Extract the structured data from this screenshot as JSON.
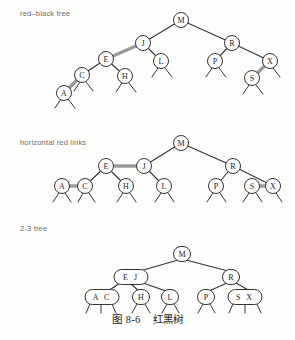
{
  "figure": {
    "caption_label": "图 8-6",
    "caption_title": "红黑树",
    "panels": [
      {
        "id": "panel-red-black-tree",
        "label": "red–black tree"
      },
      {
        "id": "panel-horizontal-links",
        "label": "horizontal red links"
      },
      {
        "id": "panel-two-three-tree",
        "label": "2-3 tree"
      }
    ]
  },
  "colors": {
    "ink": "#222222",
    "label_gray": "#6e6e6e",
    "red_link": "#9a9a9a",
    "black_link": "#333333",
    "node_fill": "#ffffff",
    "page": "#fdfdfb"
  },
  "panel1": {
    "label": "red–black tree",
    "nodes": [
      {
        "key": "M",
        "x": 181,
        "y": 20,
        "r": 7.5
      },
      {
        "key": "J",
        "x": 143,
        "y": 43,
        "r": 7.5
      },
      {
        "key": "R",
        "x": 232,
        "y": 43,
        "r": 7.5
      },
      {
        "key": "E",
        "x": 106,
        "y": 59,
        "r": 7.5
      },
      {
        "key": "L",
        "x": 161,
        "y": 61,
        "r": 7.5
      },
      {
        "key": "P",
        "x": 215,
        "y": 61,
        "r": 7.5
      },
      {
        "key": "X",
        "x": 270,
        "y": 61,
        "r": 7.5
      },
      {
        "key": "C",
        "x": 82,
        "y": 75,
        "r": 7.5
      },
      {
        "key": "H",
        "x": 125,
        "y": 76,
        "r": 7.5
      },
      {
        "key": "S",
        "x": 252,
        "y": 78,
        "r": 7.5
      },
      {
        "key": "A",
        "x": 64,
        "y": 93,
        "r": 7.5
      }
    ],
    "links": [
      {
        "from": "M",
        "to": "J",
        "type": "black"
      },
      {
        "from": "M",
        "to": "R",
        "type": "black"
      },
      {
        "from": "J",
        "to": "E",
        "type": "red"
      },
      {
        "from": "J",
        "to": "L",
        "type": "black"
      },
      {
        "from": "E",
        "to": "C",
        "type": "black"
      },
      {
        "from": "E",
        "to": "H",
        "type": "black"
      },
      {
        "from": "C",
        "to": "A",
        "type": "red"
      },
      {
        "from": "R",
        "to": "P",
        "type": "black"
      },
      {
        "from": "R",
        "to": "X",
        "type": "black"
      },
      {
        "from": "X",
        "to": "S",
        "type": "red"
      }
    ],
    "null_links": [
      "A",
      "C",
      "H",
      "L",
      "P",
      "S",
      "X"
    ]
  },
  "panel2": {
    "label": "horizontal red links",
    "nodes": [
      {
        "key": "M",
        "x": 181,
        "y": 143,
        "r": 7.5
      },
      {
        "key": "E",
        "x": 106,
        "y": 166,
        "r": 7.5
      },
      {
        "key": "J",
        "x": 144,
        "y": 166,
        "r": 7.5
      },
      {
        "key": "R",
        "x": 233,
        "y": 166,
        "r": 7.5
      },
      {
        "key": "A",
        "x": 62,
        "y": 186,
        "r": 7.5
      },
      {
        "key": "C",
        "x": 85,
        "y": 186,
        "r": 7.5
      },
      {
        "key": "H",
        "x": 126,
        "y": 186,
        "r": 7.5
      },
      {
        "key": "L",
        "x": 164,
        "y": 186,
        "r": 7.5
      },
      {
        "key": "P",
        "x": 216,
        "y": 186,
        "r": 7.5
      },
      {
        "key": "S",
        "x": 252,
        "y": 186,
        "r": 7.5
      },
      {
        "key": "X",
        "x": 273,
        "y": 186,
        "r": 7.5
      }
    ],
    "links": [
      {
        "from": "M",
        "to": "J",
        "type": "black"
      },
      {
        "from": "M",
        "to": "R",
        "type": "black"
      },
      {
        "from": "J",
        "to": "E",
        "type": "red"
      },
      {
        "from": "E",
        "to": "C",
        "type": "black"
      },
      {
        "from": "E",
        "to": "H",
        "type": "black"
      },
      {
        "from": "C",
        "to": "A",
        "type": "red"
      },
      {
        "from": "J",
        "to": "L",
        "type": "black"
      },
      {
        "from": "R",
        "to": "P",
        "type": "black"
      },
      {
        "from": "R",
        "to": "X",
        "type": "black"
      },
      {
        "from": "X",
        "to": "S",
        "type": "red"
      }
    ],
    "null_links": [
      "A",
      "C",
      "H",
      "L",
      "P",
      "S",
      "X"
    ]
  },
  "panel3": {
    "label": "2-3 tree",
    "nodes": [
      {
        "keys": "M",
        "cx": 182,
        "cy": 254,
        "w": 17,
        "h": 15
      },
      {
        "keys": "E J",
        "cx": 131,
        "cy": 277,
        "w": 34,
        "h": 15
      },
      {
        "keys": "R",
        "cx": 231,
        "cy": 277,
        "w": 17,
        "h": 15
      },
      {
        "keys": "A C",
        "cx": 102,
        "cy": 297,
        "w": 34,
        "h": 15
      },
      {
        "keys": "H",
        "cx": 141,
        "cy": 297,
        "w": 17,
        "h": 15
      },
      {
        "keys": "L",
        "cx": 170,
        "cy": 297,
        "w": 17,
        "h": 15
      },
      {
        "keys": "P",
        "cx": 206,
        "cy": 297,
        "w": 17,
        "h": 15
      },
      {
        "keys": "S X",
        "cx": 245,
        "cy": 297,
        "w": 34,
        "h": 15
      }
    ],
    "links": [
      {
        "from": "M",
        "to": "E J"
      },
      {
        "from": "M",
        "to": "R"
      },
      {
        "from": "E J",
        "to": "A C"
      },
      {
        "from": "E J",
        "to": "H"
      },
      {
        "from": "E J",
        "to": "L"
      },
      {
        "from": "R",
        "to": "P"
      },
      {
        "from": "R",
        "to": "S X"
      }
    ]
  }
}
